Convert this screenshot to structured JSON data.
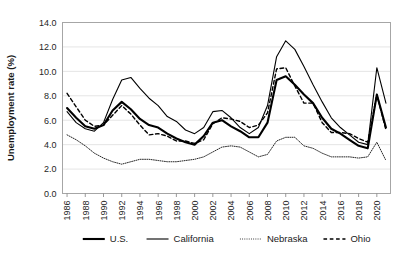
{
  "chart_data": {
    "type": "line",
    "title": "",
    "xlabel": "",
    "ylabel": "Unemployment rate (%)",
    "ylim": [
      0,
      14
    ],
    "ytick_labels": [
      "0.0",
      "2.0",
      "4.0",
      "6.0",
      "8.0",
      "10.0",
      "12.0",
      "14.0"
    ],
    "ytick_values": [
      0,
      2,
      4,
      6,
      8,
      10,
      12,
      14
    ],
    "grid": true,
    "legend_position": "bottom",
    "x": [
      1986,
      1987,
      1988,
      1989,
      1990,
      1991,
      1992,
      1993,
      1994,
      1995,
      1996,
      1997,
      1998,
      1999,
      2000,
      2001,
      2002,
      2003,
      2004,
      2005,
      2006,
      2007,
      2008,
      2009,
      2010,
      2011,
      2012,
      2013,
      2014,
      2015,
      2016,
      2017,
      2018,
      2019,
      2020,
      2021
    ],
    "xtick_labels": [
      "1986",
      "1988",
      "1990",
      "1992",
      "1994",
      "1996",
      "1998",
      "2000",
      "2002",
      "2004",
      "2006",
      "2008",
      "2010",
      "2012",
      "2014",
      "2016",
      "2018",
      "2020"
    ],
    "xtick_values": [
      1986,
      1988,
      1990,
      1992,
      1994,
      1996,
      1998,
      2000,
      2002,
      2004,
      2006,
      2008,
      2010,
      2012,
      2014,
      2016,
      2018,
      2020
    ],
    "series": [
      {
        "name": "U.S.",
        "style": "solid-thick",
        "width": 2.1,
        "color": "#000000",
        "values": [
          7.0,
          6.2,
          5.5,
          5.3,
          5.6,
          6.8,
          7.5,
          6.9,
          6.1,
          5.6,
          5.4,
          4.9,
          4.5,
          4.2,
          4.0,
          4.7,
          5.8,
          6.0,
          5.5,
          5.1,
          4.6,
          4.6,
          5.8,
          9.3,
          9.6,
          8.9,
          8.1,
          7.4,
          6.2,
          5.3,
          4.9,
          4.4,
          3.9,
          3.7,
          8.1,
          5.4
        ]
      },
      {
        "name": "California",
        "style": "solid-medium",
        "width": 1.1,
        "color": "#000000",
        "values": [
          6.7,
          5.8,
          5.3,
          5.1,
          5.8,
          7.7,
          9.3,
          9.5,
          8.6,
          7.8,
          7.2,
          6.3,
          5.9,
          5.2,
          4.9,
          5.4,
          6.7,
          6.8,
          6.2,
          5.4,
          4.9,
          5.4,
          7.2,
          11.2,
          12.5,
          11.8,
          10.4,
          8.9,
          7.5,
          6.2,
          5.4,
          4.8,
          4.2,
          4.0,
          10.3,
          7.4
        ]
      },
      {
        "name": "Nebraska",
        "style": "dotted",
        "width": 0.85,
        "color": "#000000",
        "values": [
          4.8,
          4.4,
          3.9,
          3.3,
          2.9,
          2.6,
          2.4,
          2.6,
          2.8,
          2.8,
          2.7,
          2.6,
          2.6,
          2.7,
          2.8,
          3.0,
          3.4,
          3.8,
          3.9,
          3.8,
          3.4,
          3.0,
          3.2,
          4.3,
          4.6,
          4.6,
          3.9,
          3.7,
          3.3,
          3.0,
          3.0,
          3.0,
          2.9,
          3.0,
          4.2,
          2.7
        ]
      },
      {
        "name": "Ohio",
        "style": "dashed",
        "width": 1.4,
        "color": "#000000",
        "values": [
          8.2,
          7.1,
          6.0,
          5.5,
          5.6,
          6.4,
          7.2,
          6.5,
          5.6,
          4.8,
          4.9,
          4.7,
          4.3,
          4.3,
          4.1,
          4.4,
          5.7,
          6.2,
          6.1,
          5.9,
          5.4,
          5.6,
          6.6,
          10.2,
          10.3,
          8.8,
          7.4,
          7.4,
          5.8,
          5.0,
          5.0,
          4.9,
          4.5,
          4.2,
          8.1,
          5.2
        ]
      }
    ],
    "legend": [
      {
        "label": "U.S.",
        "style": "solid-thick"
      },
      {
        "label": "California",
        "style": "solid-medium"
      },
      {
        "label": "Nebraska",
        "style": "dotted"
      },
      {
        "label": "Ohio",
        "style": "dashed"
      }
    ],
    "colors": {
      "gridline": "#d9d9d9",
      "border": "#a6a6a6",
      "text": "#262626",
      "line": "#000000",
      "background": "#ffffff"
    }
  }
}
